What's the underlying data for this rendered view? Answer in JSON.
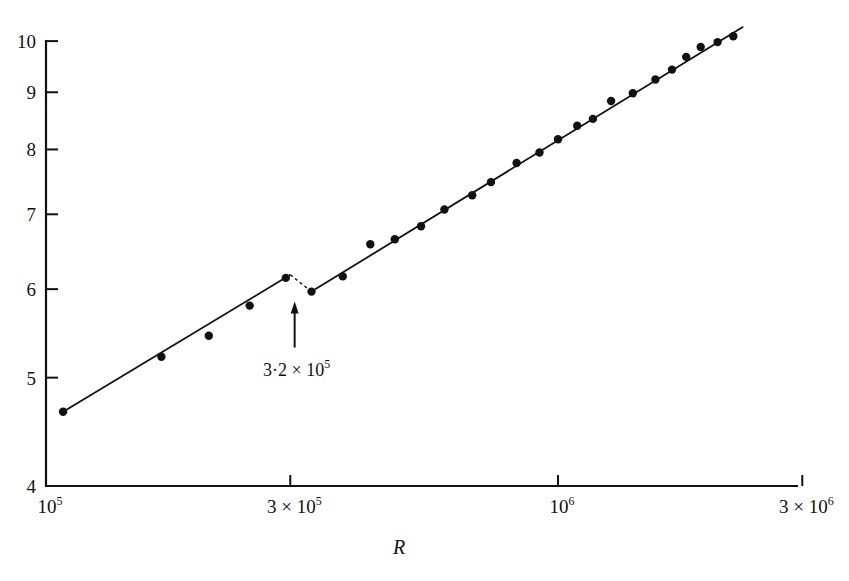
{
  "chart_data": {
    "type": "scatter",
    "title": "",
    "xlabel": "R",
    "ylabel": "",
    "xscale": "log",
    "yscale": "log",
    "xlim": [
      100000,
      3000000
    ],
    "ylim": [
      4,
      10
    ],
    "grid": false,
    "legend": null,
    "x_ticks": [
      {
        "value": 100000,
        "label": "10",
        "sup": "5"
      },
      {
        "value": 300000,
        "label": "3 × 10",
        "sup": "5"
      },
      {
        "value": 1000000,
        "label": "10",
        "sup": "6"
      },
      {
        "value": 3000000,
        "label": "3 × 10",
        "sup": "6"
      }
    ],
    "y_ticks": [
      {
        "value": 4,
        "label": "4"
      },
      {
        "value": 5,
        "label": "5"
      },
      {
        "value": 6,
        "label": "6"
      },
      {
        "value": 7,
        "label": "7"
      },
      {
        "value": 8,
        "label": "8"
      },
      {
        "value": 9,
        "label": "9"
      },
      {
        "value": 10,
        "label": "10"
      }
    ],
    "series": [
      {
        "name": "measured",
        "style": "filled-circle",
        "x": [
          108000,
          168000,
          208000,
          250000,
          294000,
          330000,
          380000,
          430000,
          480000,
          540000,
          600000,
          680000,
          740000,
          830000,
          920000,
          1000000,
          1090000,
          1170000,
          1270000,
          1400000,
          1550000,
          1670000,
          1780000,
          1900000,
          2050000,
          2200000
        ],
        "y": [
          4.66,
          5.22,
          5.45,
          5.8,
          6.14,
          5.97,
          6.16,
          6.58,
          6.65,
          6.83,
          7.07,
          7.28,
          7.48,
          7.78,
          7.95,
          8.17,
          8.4,
          8.52,
          8.84,
          8.98,
          9.24,
          9.43,
          9.68,
          9.88,
          9.98,
          10.1
        ]
      }
    ],
    "fit_lines": [
      {
        "name": "fit-below-transition",
        "style": "solid",
        "x": [
          108000,
          300000
        ],
        "y": [
          4.66,
          6.18
        ]
      },
      {
        "name": "transition-break",
        "style": "dashed",
        "x": [
          300000,
          330000
        ],
        "y": [
          6.18,
          5.97
        ]
      },
      {
        "name": "fit-above-transition",
        "style": "solid",
        "x": [
          330000,
          2300000
        ],
        "y": [
          5.97,
          10.3
        ]
      }
    ],
    "annotations": [
      {
        "text": "3·2 × 10",
        "sup": "5",
        "x": 320000,
        "arrow": "up",
        "points_to_y": 5.97
      }
    ]
  }
}
